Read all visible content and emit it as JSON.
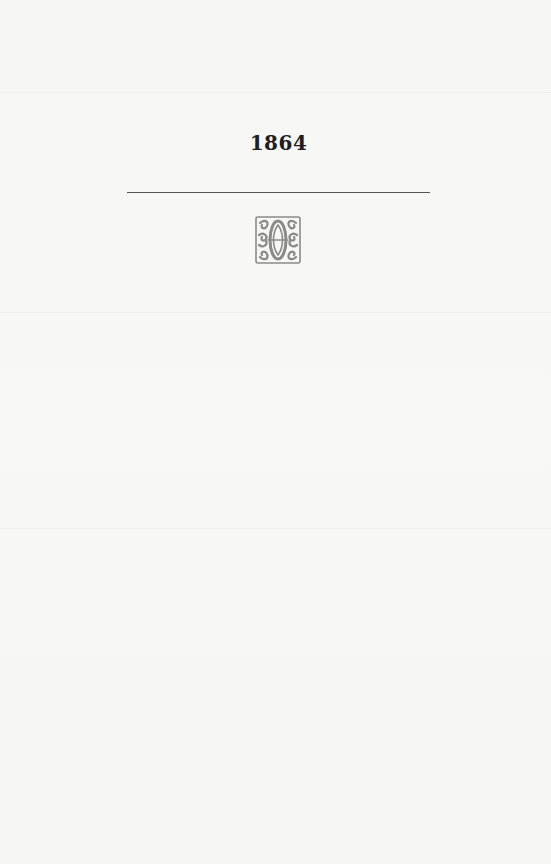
{
  "page": {
    "year": "1864",
    "ornament": "decorative-fleuron"
  },
  "colors": {
    "paper": "#f7f7f6",
    "ink": "#1e1e1e",
    "rule": "#555555",
    "ornament": "#8a8a8a"
  }
}
